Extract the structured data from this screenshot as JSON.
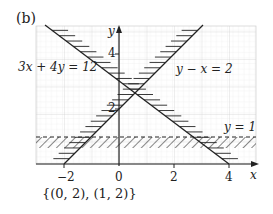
{
  "panel_label": "(b)",
  "answer": "{(0, 2), (1, 2)}",
  "axes": {
    "x_label": "x",
    "y_label": "y"
  },
  "x_ticks": [
    {
      "v": -2,
      "label": "−2"
    },
    {
      "v": 0,
      "label": "0"
    },
    {
      "v": 2,
      "label": "2"
    },
    {
      "v": 4,
      "label": "4"
    }
  ],
  "y_ticks": [
    {
      "v": 2,
      "label": "2"
    },
    {
      "v": 4,
      "label": "4"
    }
  ],
  "chart_data": {
    "type": "line",
    "title": "(b)",
    "xlabel": "x",
    "ylabel": "y",
    "xlim": [
      -3,
      5
    ],
    "ylim": [
      0,
      5
    ],
    "grid": true,
    "series": [
      {
        "name": "3x + 4y = 12",
        "equation": "3x + 4y = 12",
        "style": "solid",
        "shading": "above-right (excluded region)",
        "points": [
          [
            -2.9,
            5.2
          ],
          [
            4,
            0
          ]
        ]
      },
      {
        "name": "y − x = 2",
        "equation": "y - x = 2",
        "style": "solid",
        "shading": "left (excluded region)",
        "points": [
          [
            -2,
            0
          ],
          [
            3.2,
            5.2
          ]
        ]
      },
      {
        "name": "y = 1",
        "equation": "y = 1",
        "style": "dashed",
        "shading": "below (excluded region)",
        "points": [
          [
            -3,
            1
          ],
          [
            5,
            1
          ]
        ]
      }
    ],
    "annotations": [
      {
        "text": "3x + 4y = 12"
      },
      {
        "text": "y − x = 2"
      },
      {
        "text": "y = 1"
      },
      {
        "text": "{(0, 2), (1, 2)}"
      }
    ],
    "solution_points": [
      [
        0,
        2
      ],
      [
        1,
        2
      ]
    ]
  },
  "labels": {
    "line1": "3x + 4y = 12",
    "line2": "y − x = 2",
    "line3": "y = 1"
  }
}
